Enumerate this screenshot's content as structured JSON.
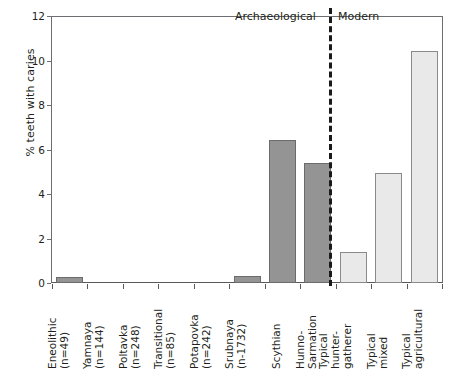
{
  "chart_data": {
    "type": "bar",
    "title": "",
    "xlabel": "",
    "ylabel": "% teeth with caries",
    "ylim": [
      0,
      12
    ],
    "yticks": [
      0,
      2,
      4,
      6,
      8,
      10,
      12
    ],
    "grid": false,
    "legend": "none",
    "categories": [
      "Eneolithic (n=49)",
      "Yamnaya (n=144)",
      "Poltavka (n=248)",
      "Transitional (n=85)",
      "Potapovka (n=242)",
      "Srubnaya (n-1732)",
      "Scythian",
      "Hunno-Sarmation",
      "Typical hunter-gatherer",
      "Typical mixed",
      "Typical agricultural"
    ],
    "values": [
      0.25,
      0.0,
      0.0,
      0.0,
      0.0,
      0.3,
      6.45,
      5.4,
      1.4,
      4.95,
      10.45
    ],
    "groups": [
      "Archaeological",
      "Modern"
    ],
    "annotations": [
      {
        "text": "Archaeological",
        "position": "top-center-left"
      },
      {
        "text": "Modern",
        "position": "top-center-right"
      }
    ],
    "divider": {
      "type": "dashed-vertical",
      "after_category": "Hunno-Sarmation"
    },
    "colors": {
      "archaeological_fill": "#949494",
      "archaeological_stroke": "#6b6b6b",
      "modern_fill": "#e9e9e9",
      "modern_stroke": "#8a8a8a",
      "axis": "#58595b",
      "text": "#231f20",
      "divider": "#1a1a1a"
    },
    "bars": [
      {
        "label": "Eneolithic",
        "sublabel": "(n=49)",
        "value": 0.25,
        "group": "Archaeological"
      },
      {
        "label": "Yamnaya",
        "sublabel": "(n=144)",
        "value": 0.0,
        "group": "Archaeological"
      },
      {
        "label": "Poltavka",
        "sublabel": "(n=248)",
        "value": 0.0,
        "group": "Archaeological"
      },
      {
        "label": "Transitional",
        "sublabel": "(n=85)",
        "value": 0.0,
        "group": "Archaeological"
      },
      {
        "label": "Potapovka",
        "sublabel": "(n=242)",
        "value": 0.0,
        "group": "Archaeological"
      },
      {
        "label": "Srubnaya",
        "sublabel": "(n-1732)",
        "value": 0.3,
        "group": "Archaeological"
      },
      {
        "label": "Scythian",
        "sublabel": "",
        "value": 6.45,
        "group": "Archaeological"
      },
      {
        "label": "Hunno-",
        "sublabel": "Sarmation",
        "value": 5.4,
        "group": "Archaeological"
      },
      {
        "label": "Typical",
        "sublabel": "hunter-",
        "sublabel2": "gatherer",
        "value": 1.4,
        "group": "Modern"
      },
      {
        "label": "Typical",
        "sublabel": "mixed",
        "value": 4.95,
        "group": "Modern"
      },
      {
        "label": "Typical",
        "sublabel": "agricultural",
        "value": 10.45,
        "group": "Modern"
      }
    ]
  },
  "axis": {
    "y_title": "% teeth with caries",
    "y_tick_labels": [
      "0",
      "2",
      "4",
      "6",
      "8",
      "10",
      "12"
    ]
  },
  "groups": {
    "archaeological_label": "Archaeological",
    "modern_label": "Modern"
  }
}
